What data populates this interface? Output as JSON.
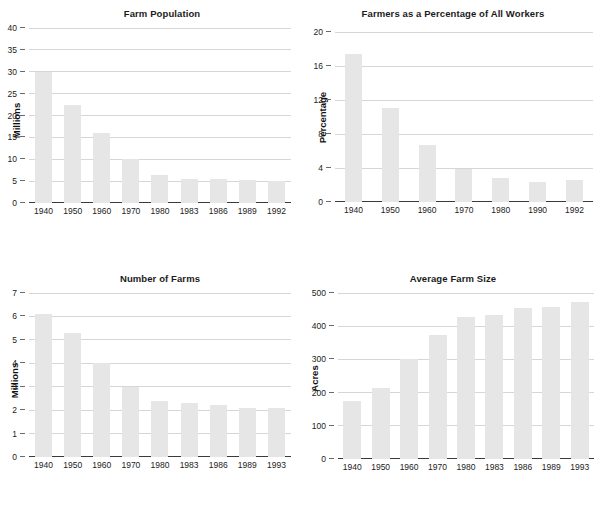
{
  "chart_data": [
    {
      "id": "farm-population",
      "type": "bar",
      "title": "Farm Population",
      "xlabel": "",
      "ylabel": "Millions",
      "ylim": [
        0,
        40
      ],
      "yticks": [
        0,
        5,
        10,
        15,
        20,
        25,
        30,
        35,
        40
      ],
      "grid": true,
      "legend": "none",
      "categories": [
        "1940",
        "1950",
        "1960",
        "1970",
        "1980",
        "1983",
        "1986",
        "1989",
        "1992"
      ],
      "values": [
        30.0,
        22.5,
        16.0,
        10.0,
        6.5,
        5.6,
        5.5,
        5.3,
        5.0
      ],
      "bar_color": "#e6e6e6"
    },
    {
      "id": "farmers-percentage",
      "type": "bar",
      "title": "Farmers as a Percentage of All Workers",
      "xlabel": "",
      "ylabel": "Percentage",
      "ylim": [
        0,
        20
      ],
      "yticks": [
        0,
        4,
        8,
        12,
        16,
        20
      ],
      "grid": true,
      "legend": "none",
      "categories": [
        "1940",
        "1950",
        "1960",
        "1970",
        "1980",
        "1990",
        "1992"
      ],
      "values": [
        17.4,
        11.1,
        6.7,
        3.9,
        2.8,
        2.4,
        2.6
      ],
      "bar_color": "#e6e6e6"
    },
    {
      "id": "number-of-farms",
      "type": "bar",
      "title": "Number of Farms",
      "xlabel": "",
      "ylabel": "Millions",
      "ylim": [
        0,
        7
      ],
      "yticks": [
        0,
        1,
        2,
        3,
        4,
        5,
        6,
        7
      ],
      "grid": true,
      "legend": "none",
      "categories": [
        "1940",
        "1950",
        "1960",
        "1970",
        "1980",
        "1983",
        "1986",
        "1989",
        "1993"
      ],
      "values": [
        6.1,
        5.3,
        4.0,
        3.0,
        2.4,
        2.3,
        2.2,
        2.1,
        2.1
      ],
      "bar_color": "#e6e6e6"
    },
    {
      "id": "average-farm-size",
      "type": "bar",
      "title": "Average Farm Size",
      "xlabel": "",
      "ylabel": "Acres",
      "ylim": [
        0,
        500
      ],
      "yticks": [
        0,
        100,
        200,
        300,
        400,
        500
      ],
      "grid": true,
      "legend": "none",
      "categories": [
        "1940",
        "1950",
        "1960",
        "1970",
        "1980",
        "1983",
        "1986",
        "1989",
        "1993"
      ],
      "values": [
        175,
        215,
        300,
        375,
        427,
        435,
        455,
        457,
        473
      ],
      "bar_color": "#e6e6e6"
    }
  ]
}
